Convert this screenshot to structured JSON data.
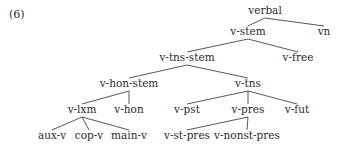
{
  "example_number": "(6)",
  "tree": {
    "title": "verbal type hierarchy",
    "nodes": {
      "verbal": {
        "label": "verbal",
        "x": 265,
        "y": 14
      },
      "v_stem": {
        "label": "v-stem",
        "x": 248,
        "y": 35
      },
      "vn": {
        "label": "vn",
        "x": 324,
        "y": 35
      },
      "v_tns_stem": {
        "label": "v-tns-stem",
        "x": 187,
        "y": 61
      },
      "v_free": {
        "label": "v-free",
        "x": 298,
        "y": 61
      },
      "v_hon_stem": {
        "label": "v-hon-stem",
        "x": 129,
        "y": 87
      },
      "v_tns": {
        "label": "v-tns",
        "x": 248,
        "y": 87
      },
      "v_lxm": {
        "label": "v-lxm",
        "x": 82,
        "y": 113
      },
      "v_hon": {
        "label": "v-hon",
        "x": 129,
        "y": 113
      },
      "v_pst": {
        "label": "v-pst",
        "x": 187,
        "y": 113
      },
      "v_pres": {
        "label": "v-pres",
        "x": 248,
        "y": 113
      },
      "v_fut": {
        "label": "v-fut",
        "x": 297,
        "y": 113
      },
      "aux_v": {
        "label": "aux-v",
        "x": 52,
        "y": 139
      },
      "cop_v": {
        "label": "cop-v",
        "x": 89,
        "y": 139
      },
      "main_v": {
        "label": "main-v",
        "x": 129,
        "y": 139
      },
      "v_st_pres": {
        "label": "v-st-pres",
        "x": 187,
        "y": 139
      },
      "v_nonst_pres": {
        "label": "v-nonst-pres",
        "x": 247,
        "y": 139
      }
    },
    "edges": [
      [
        "verbal",
        "v_stem"
      ],
      [
        "verbal",
        "vn"
      ],
      [
        "v_stem",
        "v_tns_stem"
      ],
      [
        "v_stem",
        "v_free"
      ],
      [
        "v_tns_stem",
        "v_hon_stem"
      ],
      [
        "v_tns_stem",
        "v_tns"
      ],
      [
        "v_hon_stem",
        "v_lxm"
      ],
      [
        "v_hon_stem",
        "v_hon"
      ],
      [
        "v_tns",
        "v_pst"
      ],
      [
        "v_tns",
        "v_pres"
      ],
      [
        "v_tns",
        "v_fut"
      ],
      [
        "v_lxm",
        "aux_v"
      ],
      [
        "v_lxm",
        "cop_v"
      ],
      [
        "v_lxm",
        "main_v"
      ],
      [
        "v_pres",
        "v_st_pres"
      ],
      [
        "v_pres",
        "v_nonst_pres"
      ]
    ]
  }
}
